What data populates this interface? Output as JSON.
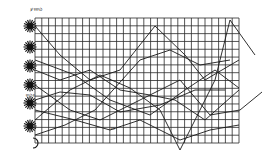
{
  "figure": {
    "colors": {
      "ink": "#1a1a1a",
      "grid": "#2a2a2a",
      "background": "#ffffff"
    },
    "grid": {
      "left": 35,
      "top": 18,
      "right": 239,
      "bottom": 143,
      "columns": 30,
      "rows": 16
    },
    "top_label": "ꝟꝛꝛꝰꝺ",
    "side_label": "ꝛꝰꝺꝛ",
    "bottom_label": "ꝛꝛ",
    "symbols": [
      {
        "name": "star-1",
        "y": 26
      },
      {
        "name": "star-2",
        "y": 47
      },
      {
        "name": "star-3",
        "y": 66
      },
      {
        "name": "star-4",
        "y": 85
      },
      {
        "name": "star-5",
        "y": 103
      },
      {
        "name": "star-6",
        "y": 126
      },
      {
        "name": "moon",
        "y": 143
      }
    ],
    "curves": [
      {
        "name": "curve-1",
        "points": "35,26 60,55 90,80 120,70 155,26 185,55 205,80 239,60"
      },
      {
        "name": "curve-2",
        "points": "35,120 70,90 100,75 130,88 160,110 180,150 215,80 230,20 255,55"
      },
      {
        "name": "curve-3",
        "points": "35,60 75,75 110,100 150,115 185,90 215,70 239,88"
      },
      {
        "name": "curve-4",
        "points": "35,135 65,125 95,110 140,60 170,50 200,65 230,60"
      },
      {
        "name": "curve-5",
        "points": "35,100 60,92 90,95 120,112 160,105 195,90 225,90"
      },
      {
        "name": "curve-6",
        "points": "35,85 70,110 100,120 140,100 180,80 210,115 240,110 262,92"
      },
      {
        "name": "curve-7",
        "points": "35,70 60,80 90,70 120,90 150,95 175,100 205,120 239,90"
      },
      {
        "name": "curve-8",
        "points": "35,110 75,120 110,130 140,120 180,140 210,130 239,125"
      }
    ]
  }
}
